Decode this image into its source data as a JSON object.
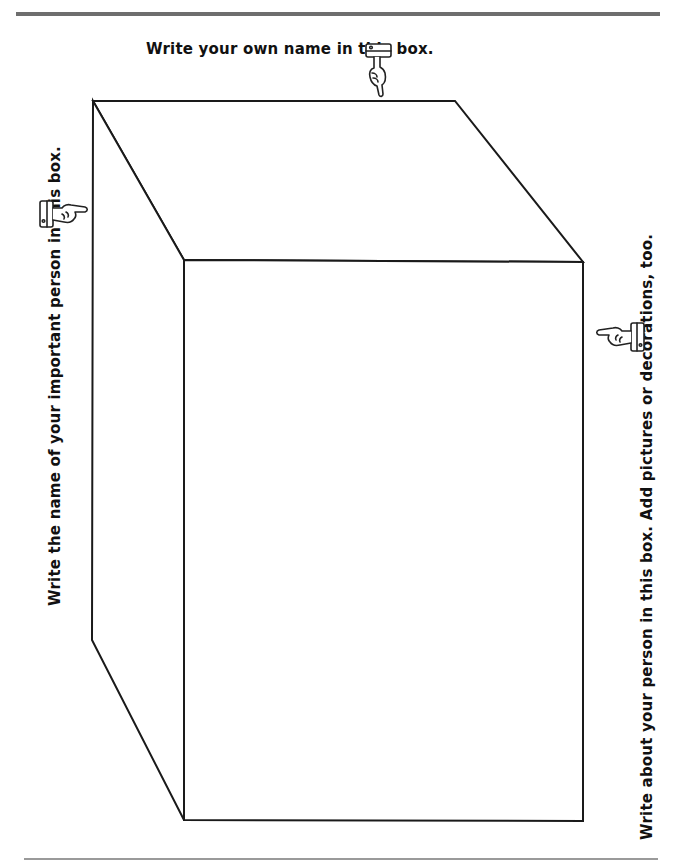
{
  "page": {
    "title_fragment": "",
    "top_rule_color": "#6e6e6e",
    "bottom_rule_color": "#9a9a9a"
  },
  "instructions": {
    "top": "Write your own name in this box.",
    "left": "Write the name of your important person in this box.",
    "right": "Write about your person in this box. Add pictures or decorations, too."
  },
  "icons": {
    "top": "pointing-hand-down-icon",
    "left": "pointing-hand-right-icon",
    "right": "pointing-hand-left-icon"
  },
  "cube": {
    "back_face": {
      "x1": 93,
      "y1": 101,
      "x2": 455,
      "y2": 640
    },
    "front_face": {
      "x1": 184,
      "y1": 260,
      "x2": 583,
      "y2": 820
    },
    "stroke_color": "#1a1a1a"
  }
}
